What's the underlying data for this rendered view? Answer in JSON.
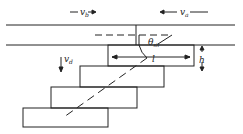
{
  "diagram": {
    "labels": {
      "vb": "v",
      "vb_sub": "b",
      "va": "v",
      "va_sub": "a",
      "vd": "v",
      "vd_sub": "d",
      "theta": "θ",
      "theta_sub": "sh",
      "l": "l",
      "h": "h"
    },
    "colors": {
      "line": "#222222",
      "background": "#ffffff"
    }
  }
}
